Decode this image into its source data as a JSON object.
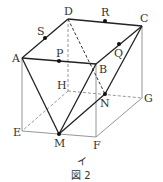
{
  "figure": {
    "caption": "図 2",
    "sub_label": "イ",
    "colors": {
      "solid": "#222222",
      "thin": "#888888",
      "dashed": "#888888",
      "point": "#111111"
    }
  },
  "vertices": {
    "A": {
      "label": "A",
      "x": 22,
      "y": 58
    },
    "B": {
      "label": "B",
      "x": 96,
      "y": 64
    },
    "C": {
      "label": "C",
      "x": 142,
      "y": 26
    },
    "D": {
      "label": "D",
      "x": 68,
      "y": 19
    },
    "E": {
      "label": "E",
      "x": 22,
      "y": 131
    },
    "F": {
      "label": "F",
      "x": 96,
      "y": 137
    },
    "G": {
      "label": "G",
      "x": 142,
      "y": 98
    },
    "H": {
      "label": "H",
      "x": 68,
      "y": 91
    }
  },
  "points": {
    "P": {
      "label": "P",
      "x": 59,
      "y": 61
    },
    "Q": {
      "label": "Q",
      "x": 119,
      "y": 44
    },
    "R": {
      "label": "R",
      "x": 105,
      "y": 21
    },
    "S": {
      "label": "S",
      "x": 45,
      "y": 38
    },
    "M": {
      "label": "M",
      "x": 59,
      "y": 134
    },
    "N": {
      "label": "N",
      "x": 105,
      "y": 94
    }
  }
}
